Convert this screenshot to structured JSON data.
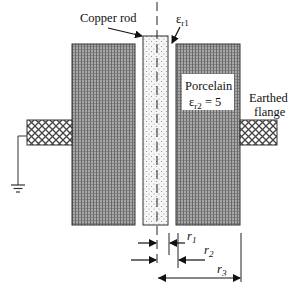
{
  "diagram": {
    "labels": {
      "copper_rod": "Copper rod",
      "eps_r1": "ε",
      "eps_r1_sub": "r1",
      "porcelain": "Porcelain",
      "eps_r2": "ε",
      "eps_r2_sub": "r2",
      "eps_r2_value": " = 5",
      "earthed_line1": "Earthed",
      "earthed_line2": "flange",
      "r1": "r",
      "r1_sub": "1",
      "r2": "r",
      "r2_sub": "2",
      "r3": "r",
      "r3_sub": "3"
    },
    "colors": {
      "porcelain_fill": "#9a9a9a",
      "porcelain_dot": "#5c5c5c",
      "rod_fill": "#f4f4f4",
      "rod_dot": "#8a8a8a",
      "flange_fill": "#ffffff",
      "flange_hatch": "#555555",
      "line": "#222222"
    }
  }
}
